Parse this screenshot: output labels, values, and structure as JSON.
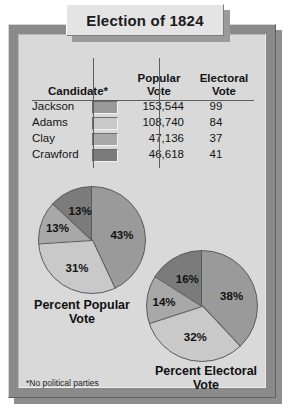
{
  "title": "Election of 1824",
  "footnote": "*No political parties",
  "table": {
    "headers": {
      "candidate": "Candidate*",
      "popular": "Popular\nVote",
      "popular_line1": "Popular",
      "popular_line2": "Vote",
      "electoral_line1": "Electoral",
      "electoral_line2": "Vote"
    },
    "rows": [
      {
        "candidate": "Jackson",
        "swatch": "#9a9a9a",
        "popular_vote": "153,544",
        "electoral_vote": "99"
      },
      {
        "candidate": "Adams",
        "swatch": "#c9c9c9",
        "popular_vote": "108,740",
        "electoral_vote": "84"
      },
      {
        "candidate": "Clay",
        "swatch": "#a8a8a8",
        "popular_vote": "47,136",
        "electoral_vote": "37"
      },
      {
        "candidate": "Crawford",
        "swatch": "#7b7b7b",
        "popular_vote": "46,618",
        "electoral_vote": "41"
      }
    ]
  },
  "charts": {
    "popular": {
      "caption_line1": "Percent Popular",
      "caption_line2": "Vote",
      "labels": [
        "43%",
        "31%",
        "13%",
        "13%"
      ]
    },
    "electoral": {
      "caption_line1": "Percent Electoral",
      "caption_line2": "Vote",
      "labels": [
        "38%",
        "32%",
        "14%",
        "16%"
      ]
    }
  },
  "chart_data": [
    {
      "type": "pie",
      "title": "Percent Popular Vote",
      "categories": [
        "Jackson",
        "Adams",
        "Clay",
        "Crawford"
      ],
      "values": [
        43,
        31,
        13,
        13
      ],
      "labels": [
        "43%",
        "31%",
        "13%",
        "13%"
      ],
      "colors": [
        "#9a9a9a",
        "#c9c9c9",
        "#a8a8a8",
        "#7b7b7b"
      ],
      "start_angle_deg": 0,
      "direction": "clockwise",
      "legend": "table-swatches"
    },
    {
      "type": "pie",
      "title": "Percent Electoral Vote",
      "categories": [
        "Jackson",
        "Adams",
        "Clay",
        "Crawford"
      ],
      "values": [
        38,
        32,
        14,
        16
      ],
      "labels": [
        "38%",
        "32%",
        "14%",
        "16%"
      ],
      "colors": [
        "#9a9a9a",
        "#c9c9c9",
        "#a8a8a8",
        "#7b7b7b"
      ],
      "start_angle_deg": 0,
      "direction": "clockwise",
      "legend": "table-swatches"
    }
  ]
}
